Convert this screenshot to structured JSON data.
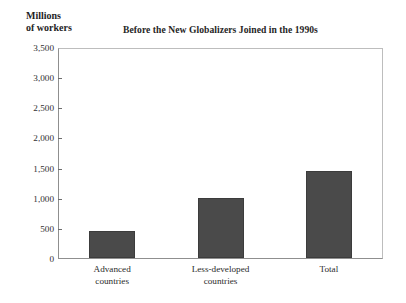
{
  "chart_data": {
    "type": "bar",
    "title": "Before the New Globalizers Joined in the 1990s",
    "ylabel_line1": "Millions",
    "ylabel_line2": "of workers",
    "xlabel": "",
    "categories": [
      "Advanced countries",
      "Less-developed countries",
      "Total"
    ],
    "category_lines": [
      [
        "Advanced",
        "countries"
      ],
      [
        "Less-developed",
        "countries"
      ],
      [
        "Total"
      ]
    ],
    "values": [
      450,
      1000,
      1450
    ],
    "ylim": [
      0,
      3500
    ],
    "ytick_labels": [
      "0",
      "500",
      "1,000",
      "1,500",
      "2,000",
      "2,500",
      "3,000",
      "3,500"
    ],
    "ytick_values": [
      0,
      500,
      1000,
      1500,
      2000,
      2500,
      3000,
      3500
    ],
    "grid": false,
    "legend": "none",
    "bar_color": "#4a4a4a",
    "frame_color": "#8f8f8f"
  }
}
